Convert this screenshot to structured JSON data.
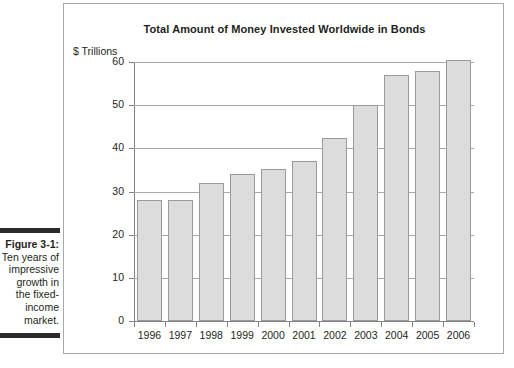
{
  "caption": {
    "figure_label": "Figure 3-1:",
    "body": "Ten years of impressive growth in the fixed-income market."
  },
  "chart_data": {
    "type": "bar",
    "title": "Total Amount of Money Invested Worldwide in Bonds",
    "xlabel": "",
    "ylabel": "$ Trillions",
    "ylim": [
      0,
      60
    ],
    "ytick_labels": [
      "60",
      "50",
      "40",
      "30",
      "20",
      "10",
      "0"
    ],
    "yticks": [
      60,
      50,
      40,
      30,
      20,
      10,
      0
    ],
    "grid": true,
    "legend": "none",
    "categories": [
      "1996",
      "1997",
      "1998",
      "1999",
      "2000",
      "2001",
      "2002",
      "2003",
      "2004",
      "2005",
      "2006"
    ],
    "values": [
      28,
      28,
      32,
      34,
      35.3,
      37,
      42.5,
      50,
      57,
      58,
      60.5
    ],
    "bar_fill_color": "#dcdcdc",
    "bar_border_color": "#9a9a9a",
    "axis_color": "#808285",
    "grid_color": "#a7a9ac",
    "text_color": "#231f20"
  }
}
